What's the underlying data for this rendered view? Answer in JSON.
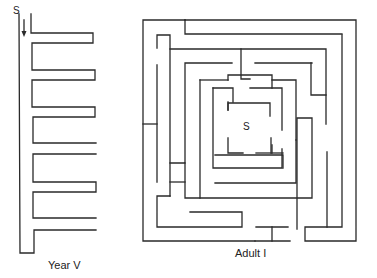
{
  "figures": [
    {
      "id": "year-v",
      "caption": "Year V",
      "start_label": "S",
      "has_arrow": true
    },
    {
      "id": "adult-i",
      "caption": "Adult I",
      "start_label": "S"
    }
  ],
  "colors": {
    "line": "#2a2a2a",
    "background": "#ffffff"
  }
}
